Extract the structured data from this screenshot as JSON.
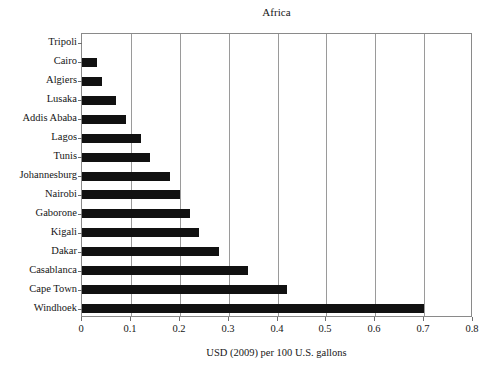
{
  "chart_data": {
    "type": "bar",
    "orientation": "horizontal",
    "title": "Africa",
    "xlabel": "USD (2009) per 100 U.S. gallons",
    "ylabel": "",
    "xlim": [
      0,
      0.8
    ],
    "xticks": [
      0,
      0.1,
      0.2,
      0.3,
      0.4,
      0.5,
      0.6,
      0.7,
      0.8
    ],
    "xtick_labels": [
      "0",
      "0.1",
      "0.2",
      "0.3",
      "0.4",
      "0.5",
      "0.6",
      "0.7",
      "0.8"
    ],
    "grid": "vertical",
    "legend": null,
    "bar_color": "#111111",
    "categories": [
      "Tripoli",
      "Cairo",
      "Algiers",
      "Lusaka",
      "Addis Ababa",
      "Lagos",
      "Tunis",
      "Johannesburg",
      "Nairobi",
      "Gaborone",
      "Kigali",
      "Dakar",
      "Casablanca",
      "Cape Town",
      "Windhoek"
    ],
    "values": [
      0.0,
      0.03,
      0.04,
      0.07,
      0.09,
      0.12,
      0.14,
      0.18,
      0.2,
      0.22,
      0.24,
      0.28,
      0.34,
      0.42,
      0.7
    ]
  }
}
